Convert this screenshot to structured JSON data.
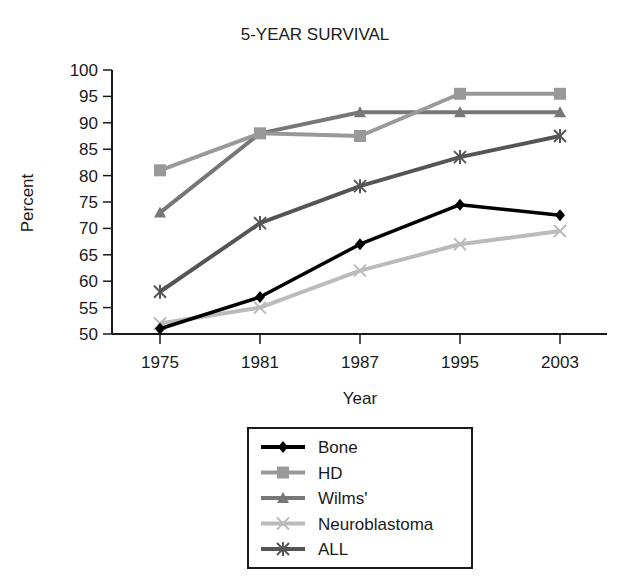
{
  "chart_data": {
    "type": "line",
    "title": "5-YEAR SURVIVAL",
    "xlabel": "Year",
    "ylabel": "Percent",
    "categories": [
      "1975",
      "1981",
      "1987",
      "1995",
      "2003"
    ],
    "ylim": [
      50,
      100
    ],
    "yticks": [
      50,
      55,
      60,
      65,
      70,
      75,
      80,
      85,
      90,
      95,
      100
    ],
    "grid": false,
    "legend_position": "bottom-center",
    "series": [
      {
        "name": "Bone",
        "marker": "diamond",
        "color": "#000000",
        "values": [
          51,
          57,
          67,
          74.5,
          72.5
        ]
      },
      {
        "name": "HD",
        "marker": "square",
        "color": "#999999",
        "values": [
          81,
          88,
          87.5,
          95.5,
          95.5
        ]
      },
      {
        "name": "Wilms'",
        "marker": "triangle",
        "color": "#777777",
        "values": [
          73,
          88,
          92,
          92,
          92
        ]
      },
      {
        "name": "Neuroblastoma",
        "marker": "x",
        "color": "#bbbbbb",
        "values": [
          52,
          55,
          62,
          67,
          69.5
        ]
      },
      {
        "name": "ALL",
        "marker": "asterisk",
        "color": "#555555",
        "values": [
          58,
          71,
          78,
          83.5,
          87.5
        ]
      }
    ]
  }
}
